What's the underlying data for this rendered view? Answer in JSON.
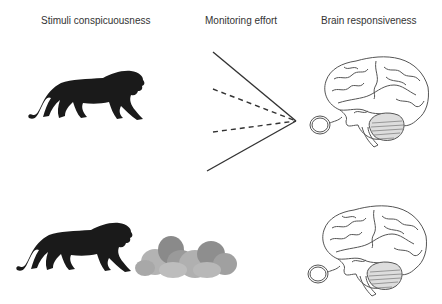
{
  "labels": {
    "stimuli": "Stimuli conspicuousness",
    "monitoring": "Monitoring effort",
    "brain": "Brain responsiveness"
  },
  "rows": [
    {
      "name": "top",
      "stimulus": "lion-visible",
      "monitoring_lines": [
        "solid",
        "dashed",
        "dashed",
        "solid"
      ],
      "brain": "brain-side-view"
    },
    {
      "name": "bottom",
      "stimulus": "lion-beside-bushes",
      "monitoring_lines": [],
      "brain": "brain-side-view"
    }
  ],
  "colors": {
    "lion": "#1a1a1a",
    "bush_dark": "#8a8a8a",
    "bush_light": "#b3b3b3",
    "line": "#333333",
    "brain_stroke": "#555555",
    "text": "#333333"
  }
}
